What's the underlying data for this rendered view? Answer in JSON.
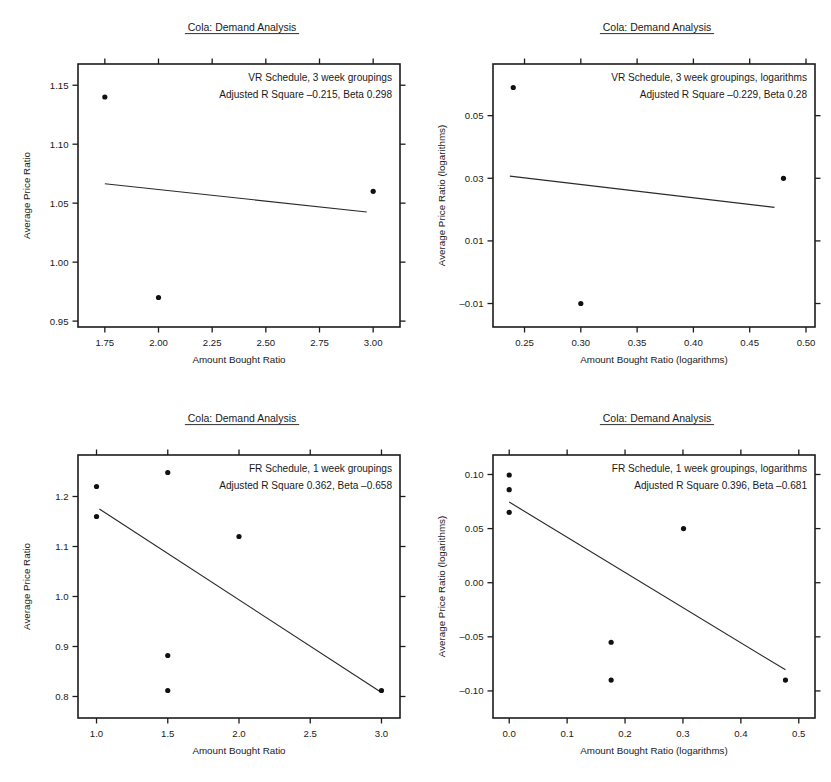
{
  "figure": {
    "panel_count": 4,
    "background_color": "#ffffff",
    "ink_color": "#1a1a1a"
  },
  "chart_data": [
    {
      "id": "panel-top-left",
      "type": "scatter",
      "title": "Cola: Demand Analysis",
      "title_underlined": true,
      "xlabel": "Amount Bought Ratio",
      "ylabel": "Average Price Ratio",
      "annotations": [
        "VR Schedule, 3 week groupings",
        "Adjusted R Square –0.215, Beta 0.298"
      ],
      "adjusted_r_square": -0.215,
      "beta": 0.298,
      "schedule": "VR",
      "grouping": "3 week groupings",
      "scale": "linear",
      "xlim": [
        1.625,
        3.125
      ],
      "ylim": [
        0.945,
        1.168
      ],
      "xticks": [
        1.75,
        2.0,
        2.25,
        2.5,
        2.75,
        3.0
      ],
      "xticklabels": [
        "1.75",
        "2.00",
        "2.25",
        "2.50",
        "2.75",
        "3.00"
      ],
      "yticks": [
        0.95,
        1.0,
        1.05,
        1.1,
        1.15
      ],
      "yticklabels": [
        "0.95",
        "1.00",
        "1.05",
        "1.10",
        "1.15"
      ],
      "grid": false,
      "points": [
        {
          "x": 1.75,
          "y": 1.14
        },
        {
          "x": 2.0,
          "y": 0.97
        },
        {
          "x": 3.0,
          "y": 1.06
        }
      ],
      "fit_line": {
        "x1": 1.75,
        "y1": 1.0665,
        "x2": 2.97,
        "y2": 1.0425
      }
    },
    {
      "id": "panel-top-right",
      "type": "scatter",
      "title": "Cola: Demand Analysis",
      "title_underlined": true,
      "xlabel": "Amount Bought Ratio (logarithms)",
      "ylabel": "Average Price Ratio (logarithms)",
      "annotations": [
        "VR Schedule, 3 week groupings, logarithms",
        "Adjusted R Square –0.229, Beta 0.28"
      ],
      "adjusted_r_square": -0.229,
      "beta": 0.28,
      "schedule": "VR",
      "grouping": "3 week groupings",
      "scale": "logarithms",
      "xlim": [
        0.222,
        0.508
      ],
      "ylim": [
        -0.0175,
        0.0665
      ],
      "xticks": [
        0.25,
        0.3,
        0.35,
        0.4,
        0.45,
        0.5
      ],
      "xticklabels": [
        "0.25",
        "0.30",
        "0.35",
        "0.40",
        "0.45",
        "0.50"
      ],
      "yticks": [
        -0.01,
        0.01,
        0.03,
        0.05
      ],
      "yticklabels": [
        "–0.01",
        "0.01",
        "0.03",
        "0.05"
      ],
      "grid": false,
      "points": [
        {
          "x": 0.24,
          "y": 0.059
        },
        {
          "x": 0.3,
          "y": -0.01
        },
        {
          "x": 0.48,
          "y": 0.03
        }
      ],
      "fit_line": {
        "x1": 0.237,
        "y1": 0.0307,
        "x2": 0.472,
        "y2": 0.0207
      }
    },
    {
      "id": "panel-bottom-left",
      "type": "scatter",
      "title": "Cola: Demand Analysis",
      "title_underlined": true,
      "xlabel": "Amount Bought Ratio",
      "ylabel": "Average Price Ratio",
      "annotations": [
        "FR Schedule, 1 week groupings",
        "Adjusted R Square 0.362, Beta –0.658"
      ],
      "adjusted_r_square": 0.362,
      "beta": -0.658,
      "schedule": "FR",
      "grouping": "1 week groupings",
      "scale": "linear",
      "xlim": [
        0.87,
        3.13
      ],
      "ylim": [
        0.757,
        1.283
      ],
      "xticks": [
        1.0,
        1.5,
        2.0,
        2.5,
        3.0
      ],
      "xticklabels": [
        "1.0",
        "1.5",
        "2.0",
        "2.5",
        "3.0"
      ],
      "yticks": [
        0.8,
        0.9,
        1.0,
        1.1,
        1.2
      ],
      "yticklabels": [
        "0.8",
        "0.9",
        "1.0",
        "1.1",
        "1.2"
      ],
      "grid": false,
      "points": [
        {
          "x": 1.0,
          "y": 1.22
        },
        {
          "x": 1.0,
          "y": 1.16
        },
        {
          "x": 1.5,
          "y": 1.248
        },
        {
          "x": 1.5,
          "y": 0.882
        },
        {
          "x": 1.5,
          "y": 0.812
        },
        {
          "x": 2.0,
          "y": 1.12
        },
        {
          "x": 3.0,
          "y": 0.812
        }
      ],
      "fit_line": {
        "x1": 1.02,
        "y1": 1.175,
        "x2": 3.0,
        "y2": 0.808
      }
    },
    {
      "id": "panel-bottom-right",
      "type": "scatter",
      "title": "Cola: Demand Analysis",
      "title_underlined": true,
      "xlabel": "Amount Bought Ratio (logarithms)",
      "ylabel": "Average Price Ratio (logarithms)",
      "annotations": [
        "FR Schedule, 1 week groupings, logarithms",
        "Adjusted R Square 0.396, Beta –0.681"
      ],
      "adjusted_r_square": 0.396,
      "beta": -0.681,
      "schedule": "FR",
      "grouping": "1 week groupings",
      "scale": "logarithms",
      "xlim": [
        -0.028,
        0.528
      ],
      "ylim": [
        -0.125,
        0.118
      ],
      "xticks": [
        0.0,
        0.1,
        0.2,
        0.3,
        0.4,
        0.5
      ],
      "xticklabels": [
        "0.0",
        "0.1",
        "0.2",
        "0.3",
        "0.4",
        "0.5"
      ],
      "yticks": [
        -0.1,
        -0.05,
        0.0,
        0.05,
        0.1
      ],
      "yticklabels": [
        "–0.10",
        "–0.05",
        "0.00",
        "0.05",
        "0.10"
      ],
      "grid": false,
      "points": [
        {
          "x": 0.0,
          "y": 0.0995
        },
        {
          "x": 0.0,
          "y": 0.086
        },
        {
          "x": 0.0,
          "y": 0.065
        },
        {
          "x": 0.176,
          "y": -0.055
        },
        {
          "x": 0.176,
          "y": -0.09
        },
        {
          "x": 0.301,
          "y": 0.05
        },
        {
          "x": 0.477,
          "y": -0.09
        }
      ],
      "fit_line": {
        "x1": 0.0,
        "y1": 0.0745,
        "x2": 0.477,
        "y2": -0.0805
      }
    }
  ]
}
